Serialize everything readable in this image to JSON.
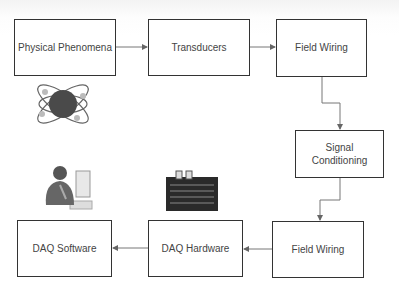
{
  "diagram": {
    "type": "block-flow",
    "nodes": [
      {
        "id": "physical",
        "label": "Physical Phenomena"
      },
      {
        "id": "transducers",
        "label": "Transducers"
      },
      {
        "id": "field_wiring_1",
        "label": "Field Wiring"
      },
      {
        "id": "signal",
        "label_line1": "Signal",
        "label_line2": "Conditioning"
      },
      {
        "id": "field_wiring_2",
        "label": "Field Wiring"
      },
      {
        "id": "daq_hw",
        "label": "DAQ Hardware"
      },
      {
        "id": "daq_sw",
        "label": "DAQ Software"
      }
    ],
    "edges": [
      [
        "physical",
        "transducers"
      ],
      [
        "transducers",
        "field_wiring_1"
      ],
      [
        "field_wiring_1",
        "signal"
      ],
      [
        "signal",
        "field_wiring_2"
      ],
      [
        "field_wiring_2",
        "daq_hw"
      ],
      [
        "daq_hw",
        "daq_sw"
      ]
    ],
    "illustrations": [
      "atom-icon",
      "person-at-computer-icon",
      "circuit-board-icon"
    ],
    "colors": {
      "border": "#333333",
      "text": "#444444",
      "line": "#777777"
    }
  }
}
